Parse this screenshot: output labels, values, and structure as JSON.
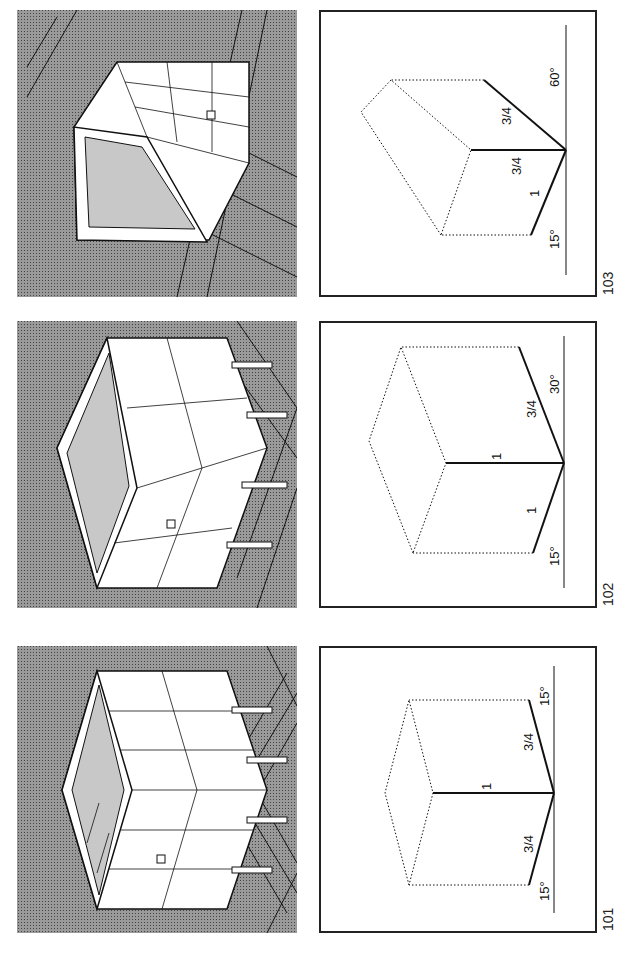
{
  "figures": [
    {
      "number": "101",
      "description": "Isometric-like projection with equal 15° angles",
      "diagram_labels": {
        "left_angle": "15°",
        "left_edge": "3/4",
        "vertical_edge": "1",
        "right_edge": "3/4",
        "right_angle": "15°"
      }
    },
    {
      "number": "102",
      "description": "Dimetric projection with 15° and 30° angles",
      "diagram_labels": {
        "left_angle": "15°",
        "left_edge": "1",
        "vertical_edge": "1",
        "right_edge": "3/4",
        "right_angle": "30°"
      }
    },
    {
      "number": "103",
      "description": "Trimetric projection with 15° and 60° angles",
      "diagram_labels": {
        "left_angle": "15°",
        "left_edge": "1",
        "vertical_edge": "3/4",
        "right_edge": "3/4",
        "right_angle": "60°"
      }
    }
  ],
  "colors": {
    "halftone_background": "#9a9a9a",
    "line": "#111111",
    "paper": "#ffffff"
  }
}
